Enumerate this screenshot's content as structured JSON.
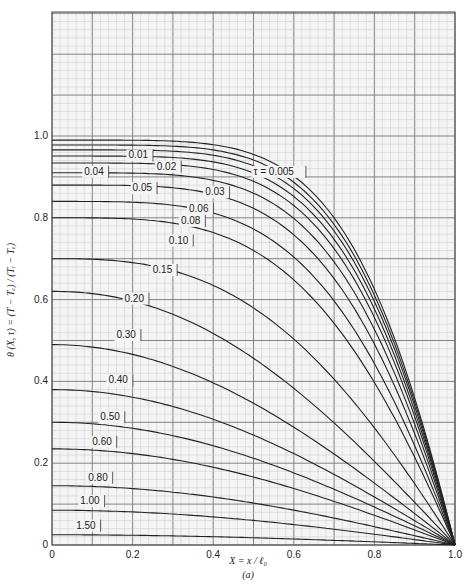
{
  "chart_data": {
    "type": "line",
    "title": "",
    "xlabel": "X = x / ℓ₀",
    "ylabel": "θ (X, τ) = (T − Tₑ) / (Tᵢ − Tₑ)",
    "caption": "(a)",
    "xlim": [
      0,
      1.0
    ],
    "ylim": [
      0,
      1.0
    ],
    "grid": true,
    "x_ticks": [
      "0",
      "0.2",
      "0.4",
      "0.6",
      "0.8",
      "1.0"
    ],
    "y_ticks": [
      "0",
      "0.2",
      "0.4",
      "0.6",
      "0.8",
      "1.0"
    ],
    "legend_position": "inline labels on curves",
    "parameter_name": "τ",
    "x": [
      0,
      0.1,
      0.2,
      0.3,
      0.4,
      0.5,
      0.6,
      0.7,
      0.8,
      0.9,
      1.0
    ],
    "series": [
      {
        "name": "τ = 0.005",
        "theta0": 0.99
      },
      {
        "name": "0.01",
        "theta0": 0.978
      },
      {
        "name": "0.02",
        "theta0": 0.966
      },
      {
        "name": "0.03",
        "theta0": 0.951
      },
      {
        "name": "0.04",
        "theta0": 0.934
      },
      {
        "name": "0.05",
        "theta0": 0.91
      },
      {
        "name": "0.06",
        "theta0": 0.88
      },
      {
        "name": "0.08",
        "theta0": 0.84
      },
      {
        "name": "0.10",
        "theta0": 0.8
      },
      {
        "name": "0.15",
        "theta0": 0.7
      },
      {
        "name": "0.20",
        "theta0": 0.62
      },
      {
        "name": "0.30",
        "theta0": 0.49
      },
      {
        "name": "0.40",
        "theta0": 0.38
      },
      {
        "name": "0.50",
        "theta0": 0.3
      },
      {
        "name": "0.60",
        "theta0": 0.235
      },
      {
        "name": "0.80",
        "theta0": 0.145
      },
      {
        "name": "1.00",
        "theta0": 0.085
      },
      {
        "name": "1.50",
        "theta0": 0.025
      }
    ],
    "label_positions": [
      {
        "name": "τ = 0.005",
        "x": 0.5,
        "y": 0.905
      },
      {
        "name": "0.01",
        "x": 0.19,
        "y": 0.945
      },
      {
        "name": "0.02",
        "x": 0.26,
        "y": 0.918
      },
      {
        "name": "0.04",
        "x": 0.08,
        "y": 0.905
      },
      {
        "name": "0.05",
        "x": 0.2,
        "y": 0.865
      },
      {
        "name": "0.03",
        "x": 0.38,
        "y": 0.855
      },
      {
        "name": "0.06",
        "x": 0.34,
        "y": 0.815
      },
      {
        "name": "0.08",
        "x": 0.32,
        "y": 0.785
      },
      {
        "name": "0.10",
        "x": 0.29,
        "y": 0.737
      },
      {
        "name": "0.15",
        "x": 0.25,
        "y": 0.665
      },
      {
        "name": "0.20",
        "x": 0.18,
        "y": 0.595
      },
      {
        "name": "0.30",
        "x": 0.16,
        "y": 0.506
      },
      {
        "name": "0.40",
        "x": 0.14,
        "y": 0.395
      },
      {
        "name": "0.50",
        "x": 0.12,
        "y": 0.305
      },
      {
        "name": "0.60",
        "x": 0.1,
        "y": 0.245
      },
      {
        "name": "0.80",
        "x": 0.09,
        "y": 0.157
      },
      {
        "name": "1.00",
        "x": 0.07,
        "y": 0.1
      },
      {
        "name": "1.50",
        "x": 0.06,
        "y": 0.04
      }
    ]
  },
  "colors": {
    "grid_minor": "#c8c8c8",
    "grid_major": "#777777",
    "curve": "#222222",
    "background": "#f4f4f4"
  }
}
